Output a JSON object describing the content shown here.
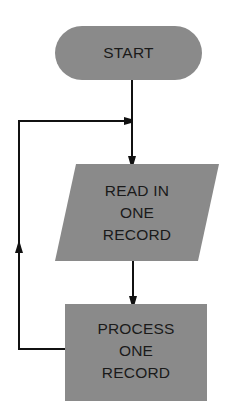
{
  "diagram": {
    "type": "flowchart",
    "colors": {
      "shape_fill": "#8a8a8a",
      "line": "#111111",
      "text": "#1a1a1a",
      "background": "#ffffff"
    },
    "nodes": [
      {
        "id": "start",
        "shape": "terminator",
        "lines": [
          "START"
        ]
      },
      {
        "id": "read",
        "shape": "input-output",
        "lines": [
          "READ IN",
          "ONE",
          "RECORD"
        ]
      },
      {
        "id": "process",
        "shape": "process",
        "lines": [
          "PROCESS",
          "ONE",
          "RECORD"
        ]
      }
    ],
    "edges": [
      {
        "from": "start",
        "to": "read"
      },
      {
        "from": "read",
        "to": "process"
      },
      {
        "from": "process",
        "to": "read",
        "note": "loop back"
      }
    ]
  }
}
